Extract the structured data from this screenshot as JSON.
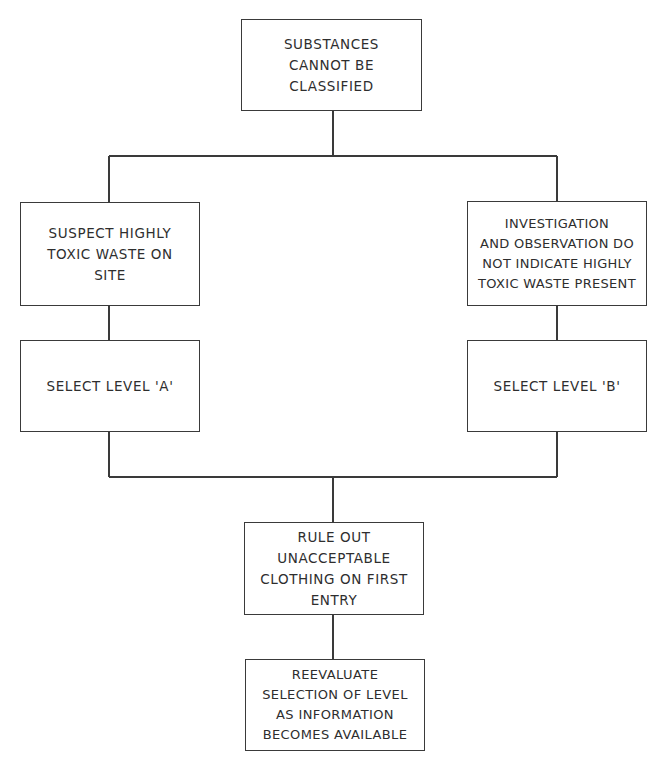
{
  "diagram": {
    "type": "flowchart",
    "nodes": {
      "start": {
        "id": "start",
        "text": "SUBSTANCES\nCANNOT BE\nCLASSIFIED"
      },
      "suspect_toxic": {
        "id": "suspect_toxic",
        "text": "SUSPECT HIGHLY\nTOXIC WASTE ON\nSITE"
      },
      "no_toxic": {
        "id": "no_toxic",
        "text": "INVESTIGATION\nAND OBSERVATION DO\nNOT INDICATE HIGHLY\nTOXIC WASTE PRESENT"
      },
      "level_a": {
        "id": "level_a",
        "text": "SELECT LEVEL 'A'"
      },
      "level_b": {
        "id": "level_b",
        "text": "SELECT LEVEL 'B'"
      },
      "rule_out": {
        "id": "rule_out",
        "text": "RULE OUT\nUNACCEPTABLE\nCLOTHING ON FIRST\nENTRY"
      },
      "reevaluate": {
        "id": "reevaluate",
        "text": "REEVALUATE\nSELECTION OF LEVEL\nAS INFORMATION\nBECOMES AVAILABLE"
      }
    },
    "edges": [
      {
        "from": "start",
        "to": "suspect_toxic"
      },
      {
        "from": "start",
        "to": "no_toxic"
      },
      {
        "from": "suspect_toxic",
        "to": "level_a"
      },
      {
        "from": "no_toxic",
        "to": "level_b"
      },
      {
        "from": "level_a",
        "to": "rule_out"
      },
      {
        "from": "level_b",
        "to": "rule_out"
      },
      {
        "from": "rule_out",
        "to": "reevaluate"
      }
    ],
    "colors": {
      "line": "#3a3a3a",
      "text": "#2e2e2e",
      "background": "#ffffff"
    }
  }
}
